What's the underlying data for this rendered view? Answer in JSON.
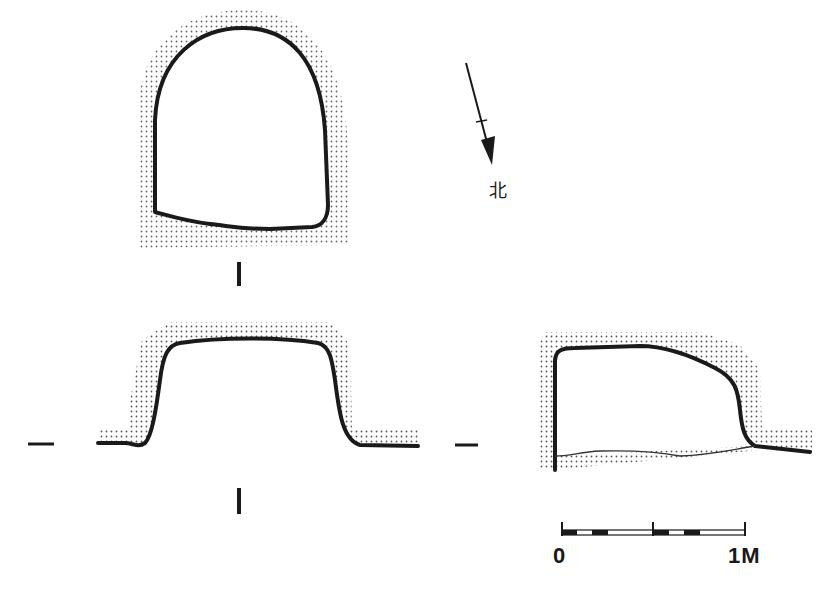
{
  "figure": {
    "type": "archaeological plan and section drawing",
    "north_arrow": {
      "label": "北"
    },
    "section_markers": {
      "plan_cut": "I",
      "profile_cut": "—"
    },
    "scale_bar": {
      "start_label": "0",
      "end_label": "1M"
    },
    "colors": {
      "line": "#1a1a1a",
      "stipple": "#555555",
      "background": "#ffffff"
    }
  }
}
